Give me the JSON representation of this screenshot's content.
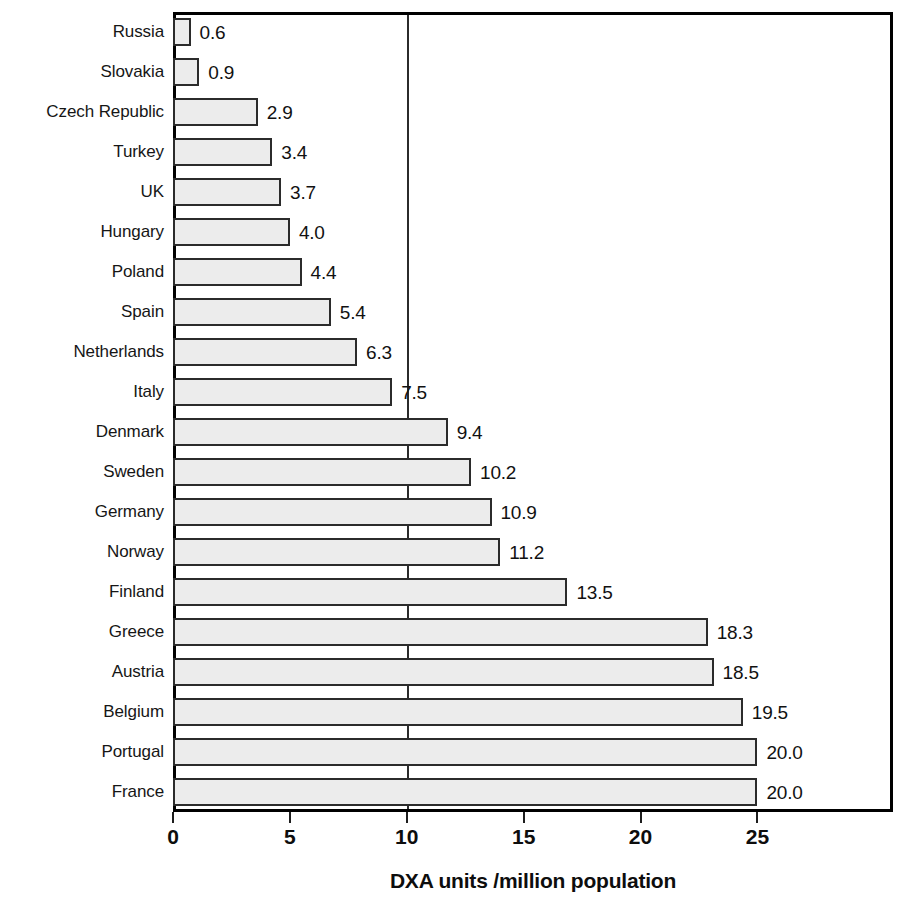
{
  "chart_data": {
    "type": "bar",
    "orientation": "horizontal",
    "title": "",
    "xlabel": "DXA units /million population",
    "ylabel": "",
    "xlim": [
      0,
      30.8
    ],
    "xticks": [
      0,
      5,
      10,
      15,
      20,
      25
    ],
    "xtick_labels": [
      "0",
      "5",
      "10",
      "15",
      "20",
      "25"
    ],
    "gridlines_x": [
      10
    ],
    "grid": true,
    "legend": false,
    "value_label_format": "one-decimal",
    "categories": [
      "Russia",
      "Slovakia",
      "Czech Republic",
      "Turkey",
      "UK",
      "Hungary",
      "Poland",
      "Spain",
      "Netherlands",
      "Italy",
      "Denmark",
      "Sweden",
      "Germany",
      "Norway",
      "Finland",
      "Greece",
      "Austria",
      "Belgium",
      "Portugal",
      "France"
    ],
    "values": [
      0.6,
      0.9,
      2.9,
      3.4,
      3.7,
      4.0,
      4.4,
      5.4,
      6.3,
      7.5,
      9.4,
      10.2,
      10.9,
      11.2,
      13.5,
      18.3,
      18.5,
      19.5,
      20.0,
      20.0
    ],
    "value_labels": [
      "0.6",
      "0.9",
      "2.9",
      "3.4",
      "3.7",
      "4.0",
      "4.4",
      "5.4",
      "6.3",
      "7.5",
      "9.4",
      "10.2",
      "10.9",
      "11.2",
      "13.5",
      "18.3",
      "18.5",
      "19.5",
      "20.0",
      "20.0"
    ],
    "bar_draw_scale": 1.25,
    "colors": {
      "bar_fill": "#ececec",
      "bar_border": "#2b2b2b",
      "frame": "#000000",
      "gridline": "#2b2b2b",
      "text": "#111111",
      "background": "#ffffff"
    }
  }
}
